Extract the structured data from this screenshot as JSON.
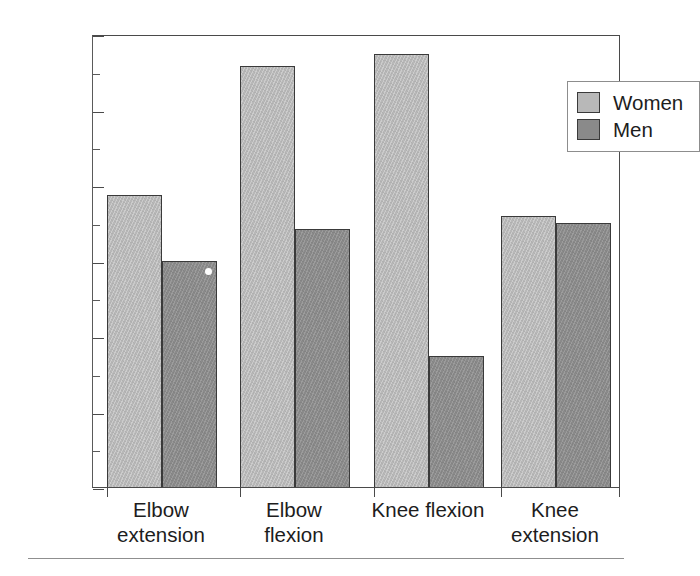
{
  "chart_data": {
    "type": "bar",
    "title": "",
    "subtitle": "",
    "xlabel": "",
    "ylabel": "Percent change",
    "categories": [
      "Elbow extension",
      "Elbow flexion",
      "Knee flexion",
      "Knee extension"
    ],
    "category_lines": [
      [
        "Elbow",
        "extension"
      ],
      [
        "Elbow",
        "flexion"
      ],
      [
        "Knee flexion",
        ""
      ],
      [
        "Knee",
        "extension"
      ]
    ],
    "series": [
      {
        "name": "Women",
        "color": "#b8b8b8",
        "values": [
          38.7,
          55.8,
          57.4,
          35.9
        ]
      },
      {
        "name": "Men",
        "color": "#8a8a8a",
        "values": [
          30.0,
          34.2,
          17.4,
          35.0
        ]
      }
    ],
    "ylim": [
      0,
      60
    ],
    "y_major_ticks": [
      0,
      10,
      20,
      30,
      40,
      50,
      60
    ],
    "y_minor_ticks": [
      5,
      15,
      25,
      35,
      45,
      55
    ],
    "y_tick_labels": [
      "0",
      "10",
      "20",
      "30",
      "40",
      "50",
      "60"
    ],
    "grid": false,
    "legend_position": "top-right",
    "legend_entries": [
      "Women",
      "Men"
    ],
    "axis_color": "#4a4a4a",
    "bar_edge_color": "#3a3a3a",
    "background": "#ffffff"
  }
}
